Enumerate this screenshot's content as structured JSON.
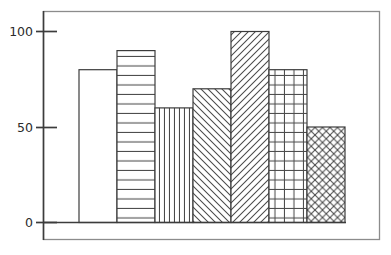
{
  "chart_data": {
    "type": "bar",
    "title": "",
    "subtitle": "",
    "xlabel": "",
    "ylabel": "",
    "categories": [
      "1",
      "2",
      "3",
      "4",
      "5",
      "6",
      "7"
    ],
    "values": [
      80,
      90,
      60,
      70,
      100,
      80,
      50
    ],
    "fill_patterns": [
      "blank",
      "horizontal-lines",
      "vertical-lines",
      "diagonal-backslash",
      "diagonal-forwardslash",
      "grid-crosshatch",
      "diagonal-crosshatch"
    ],
    "ylim": [
      0,
      110
    ],
    "xlim": [
      0,
      7
    ],
    "ytick_labels": [
      "0",
      "50",
      "100"
    ],
    "ytick_values": [
      0,
      50,
      100
    ],
    "xtick_labels": [],
    "grid": false,
    "legend": null,
    "legend_position": "none",
    "annotations": [],
    "colors": {
      "bar_edge": "#3c3c3c",
      "bar_fill": "#ffffff",
      "hatch": "#4a4a4a",
      "axis": "#3c3c3c",
      "frame": "#8c8c8c",
      "background": "#ffffff",
      "tick_label": "#2b2b2b"
    }
  },
  "axes": {
    "y_axis_name": "y-axis",
    "x_axis_name": "x-axis-baseline"
  }
}
